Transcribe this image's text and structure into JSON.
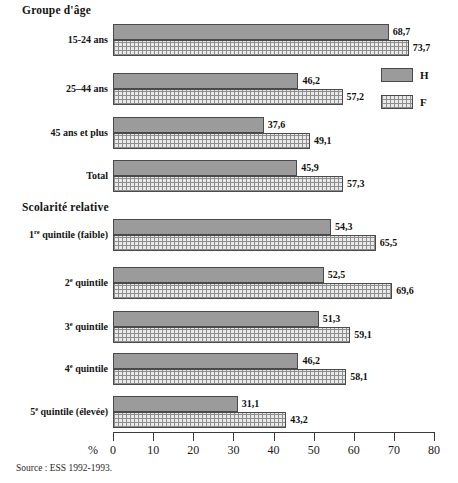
{
  "figure": {
    "source_note": "Source : ESS 1992-1993."
  },
  "legend": {
    "position": "right",
    "items": [
      {
        "key": "H",
        "label": "H",
        "swatch": "solid-gray-swatch"
      },
      {
        "key": "F",
        "label": "F",
        "swatch": "dotted-pattern-swatch"
      }
    ]
  },
  "axis": {
    "unit_label": "%",
    "ticks": [
      "0",
      "10",
      "20",
      "30",
      "40",
      "50",
      "60",
      "70",
      "80"
    ]
  },
  "sections": [
    {
      "id": "age",
      "heading": "Groupe d'âge",
      "rows": [
        {
          "label_html": "15-24 ans",
          "h": "68,7",
          "f": "73,7"
        },
        {
          "label_html": "25–44 ans",
          "h": "46,2",
          "f": "57,2"
        },
        {
          "label_html": "45 ans et plus",
          "h": "37,6",
          "f": "49,1"
        },
        {
          "label_html": "Total",
          "h": "45,9",
          "f": "57,3"
        }
      ]
    },
    {
      "id": "educ",
      "heading": "Scolarité relative",
      "rows": [
        {
          "label_html": "1<sup>re</sup> quintile (faible)",
          "h": "54,3",
          "f": "65,5"
        },
        {
          "label_html": "2<sup>e</sup> quintile",
          "h": "52,5",
          "f": "69,6"
        },
        {
          "label_html": "3<sup>e</sup> quintile",
          "h": "51,3",
          "f": "59,1"
        },
        {
          "label_html": "4<sup>e</sup> quintile",
          "h": "46,2",
          "f": "58,1"
        },
        {
          "label_html": "5<sup>e</sup> quintile (élevée)",
          "h": "31,1",
          "f": "43,2"
        }
      ]
    }
  ],
  "chart_data": {
    "type": "bar",
    "orientation": "horizontal",
    "title": "",
    "subtitle": "",
    "xlabel": "%",
    "ylabel": "",
    "xlim": [
      0,
      80
    ],
    "xticks": [
      0,
      10,
      20,
      30,
      40,
      50,
      60,
      70,
      80
    ],
    "grid": false,
    "legend_position": "right",
    "value_labels": true,
    "decimal_separator": ",",
    "group_headings": [
      "Groupe d'âge",
      "Scolarité relative"
    ],
    "categories": [
      "15-24 ans",
      "25–44 ans",
      "45 ans et plus",
      "Total",
      "1re quintile (faible)",
      "2e quintile",
      "3e quintile",
      "4e quintile",
      "5e quintile (élevée)"
    ],
    "series": [
      {
        "name": "H",
        "values": [
          68.7,
          46.2,
          37.6,
          45.9,
          54.3,
          52.5,
          51.3,
          46.2,
          31.1
        ]
      },
      {
        "name": "F",
        "values": [
          73.7,
          57.2,
          49.1,
          57.3,
          65.5,
          69.6,
          59.1,
          58.1,
          43.2
        ]
      }
    ],
    "annotations": [
      "Source : ESS 1992-1993."
    ]
  }
}
